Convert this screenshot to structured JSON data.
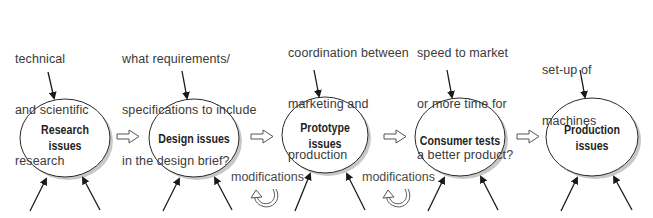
{
  "diagram": {
    "nodes": [
      {
        "id": "research",
        "label_lines": [
          "Research",
          "issues"
        ],
        "cx": 66,
        "cy": 138
      },
      {
        "id": "design",
        "label_lines": [
          "Design issues"
        ],
        "cx": 195,
        "cy": 138
      },
      {
        "id": "prototype",
        "label_lines": [
          "Prototype",
          "issues"
        ],
        "cx": 326,
        "cy": 135
      },
      {
        "id": "consumer",
        "label_lines": [
          "Consumer tests"
        ],
        "cx": 461,
        "cy": 137
      },
      {
        "id": "production",
        "label_lines": [
          "Production",
          "issues"
        ],
        "cx": 593,
        "cy": 137
      }
    ],
    "inputs": [
      {
        "node": "research",
        "lines": [
          "technical",
          "and scientific",
          "research"
        ]
      },
      {
        "node": "design",
        "lines": [
          "what requirements/",
          "specifications to include",
          "in the design brief?"
        ]
      },
      {
        "node": "prototype",
        "lines": [
          "coordination between",
          "marketing and",
          "production"
        ]
      },
      {
        "node": "consumer",
        "lines": [
          "speed to market",
          "or more time for",
          "a better product?"
        ]
      },
      {
        "node": "production",
        "lines": [
          "set-up of",
          "machines"
        ]
      }
    ],
    "feedback": [
      {
        "between": [
          "design",
          "prototype"
        ],
        "label": "modifications",
        "icon": "cycle-arrow-icon"
      },
      {
        "between": [
          "prototype",
          "consumer"
        ],
        "label": "modifications",
        "icon": "cycle-arrow-icon"
      }
    ],
    "flow_arrow_icon": "hollow-right-arrow-icon",
    "colors": {
      "stroke": "#2a2a2a",
      "shadow": "#bdbdbd",
      "text": "#3a3a3a"
    }
  }
}
